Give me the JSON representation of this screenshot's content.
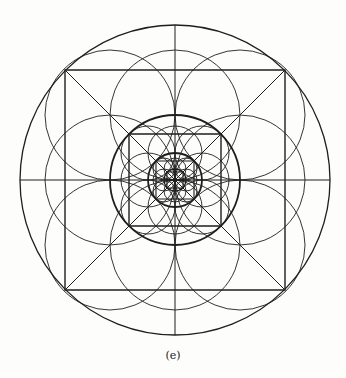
{
  "figure": {
    "caption": "(e)",
    "stroke_color": "#1e1e1e",
    "center": [
      175,
      180
    ],
    "outer_circle_r": 155,
    "levels": [
      {
        "square_half": 110,
        "ring_circle_r": 65,
        "ring_offset": 65,
        "circle_r": 65,
        "heavy": true
      },
      {
        "square_half": 46,
        "ring_circle_r": 27,
        "ring_offset": 27,
        "circle_r": 27,
        "heavy": true
      },
      {
        "square_half": 19,
        "ring_circle_r": 11,
        "ring_offset": 11,
        "circle_r": 11,
        "heavy": false
      },
      {
        "square_half": 8,
        "ring_circle_r": 0,
        "ring_offset": 0,
        "circle_r": 0,
        "heavy": false
      }
    ]
  }
}
